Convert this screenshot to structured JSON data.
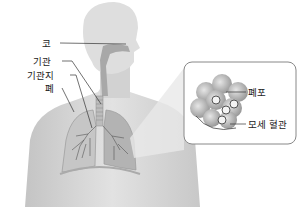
{
  "diagram": {
    "labels": {
      "nose": "코",
      "trachea": "기관",
      "bronchi": "기관지",
      "lung": "폐",
      "alveoli": "폐포",
      "capillary": "모세 혈관"
    },
    "colors": {
      "skin": "#d9d9d9",
      "skin_dark": "#bdbdbd",
      "lung": "#b5b5b5",
      "inset_border": "#888888",
      "leader_line": "#333333"
    }
  }
}
